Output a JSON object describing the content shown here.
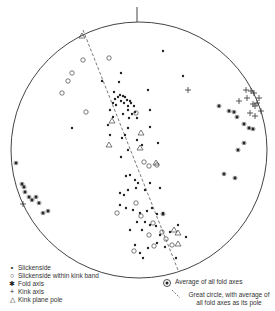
{
  "diagram": {
    "type": "stereonet",
    "center": [
      139,
      150
    ],
    "radius": 128,
    "north_tick": true,
    "great_circle_dashed": {
      "x1": 83,
      "y1": 30,
      "x2": 178,
      "y2": 270
    },
    "series": {
      "slickenside": [
        [
          163,
          51
        ],
        [
          121,
          73
        ],
        [
          119,
          82
        ],
        [
          102,
          81
        ],
        [
          148,
          90
        ],
        [
          114,
          92
        ],
        [
          120,
          95
        ],
        [
          123,
          96
        ],
        [
          118,
          97
        ],
        [
          125,
          97
        ],
        [
          115,
          99
        ],
        [
          127,
          100
        ],
        [
          121,
          101
        ],
        [
          130,
          101
        ],
        [
          113,
          103
        ],
        [
          124,
          103
        ],
        [
          131,
          103
        ],
        [
          116,
          105
        ],
        [
          128,
          106
        ],
        [
          134,
          106
        ],
        [
          110,
          110
        ],
        [
          128,
          110
        ],
        [
          135,
          112
        ],
        [
          150,
          110
        ],
        [
          113,
          117
        ],
        [
          123,
          114
        ],
        [
          132,
          114
        ],
        [
          129,
          118
        ],
        [
          137,
          118
        ],
        [
          108,
          125
        ],
        [
          128,
          128
        ],
        [
          150,
          127
        ],
        [
          110,
          135
        ],
        [
          122,
          138
        ],
        [
          125,
          135
        ],
        [
          137,
          140
        ],
        [
          142,
          145
        ],
        [
          128,
          150
        ],
        [
          158,
          143
        ],
        [
          121,
          157
        ],
        [
          126,
          176
        ],
        [
          130,
          175
        ],
        [
          135,
          180
        ],
        [
          138,
          183
        ],
        [
          136,
          188
        ],
        [
          120,
          193
        ],
        [
          128,
          190
        ],
        [
          124,
          195
        ],
        [
          145,
          190
        ],
        [
          150,
          183
        ],
        [
          160,
          188
        ],
        [
          120,
          205
        ],
        [
          126,
          208
        ],
        [
          133,
          210
        ],
        [
          140,
          213
        ],
        [
          147,
          211
        ],
        [
          152,
          208
        ],
        [
          157,
          214
        ],
        [
          163,
          213
        ],
        [
          137,
          222
        ],
        [
          145,
          222
        ],
        [
          150,
          225
        ],
        [
          156,
          226
        ],
        [
          142,
          230
        ],
        [
          130,
          230
        ],
        [
          170,
          232
        ],
        [
          178,
          225
        ],
        [
          160,
          235
        ],
        [
          157,
          243
        ],
        [
          165,
          247
        ],
        [
          148,
          248
        ],
        [
          135,
          245
        ],
        [
          140,
          253
        ],
        [
          143,
          258
        ],
        [
          176,
          258
        ],
        [
          72,
          128
        ],
        [
          183,
          76
        ],
        [
          186,
          237
        ]
      ],
      "slickenside_in_kink": [
        [
          83,
          60
        ],
        [
          109,
          58
        ],
        [
          72,
          73
        ],
        [
          68,
          81
        ],
        [
          62,
          93
        ],
        [
          86,
          112
        ],
        [
          136,
          113
        ],
        [
          144,
          162
        ],
        [
          149,
          166
        ],
        [
          157,
          165
        ],
        [
          117,
          213
        ],
        [
          136,
          203
        ],
        [
          141,
          216
        ],
        [
          153,
          223
        ],
        [
          149,
          235
        ],
        [
          162,
          232
        ],
        [
          166,
          239
        ],
        [
          172,
          245
        ],
        [
          154,
          246
        ],
        [
          134,
          251
        ]
      ],
      "fold_axis": [
        [
          219,
          106
        ],
        [
          229,
          111
        ],
        [
          234,
          112
        ],
        [
          237,
          117
        ],
        [
          244,
          124
        ],
        [
          249,
          128
        ],
        [
          253,
          129
        ],
        [
          244,
          143
        ],
        [
          238,
          150
        ],
        [
          224,
          174
        ],
        [
          235,
          178
        ],
        [
          16,
          163
        ],
        [
          22,
          184
        ],
        [
          24,
          187
        ],
        [
          25,
          192
        ],
        [
          29,
          197
        ],
        [
          32,
          200
        ],
        [
          36,
          197
        ],
        [
          39,
          203
        ],
        [
          43,
          213
        ],
        [
          48,
          211
        ],
        [
          163,
          214
        ]
      ],
      "kink_axis": [
        [
          188,
          90
        ],
        [
          246,
          90
        ],
        [
          251,
          91
        ],
        [
          254,
          93
        ],
        [
          239,
          101
        ],
        [
          247,
          98
        ],
        [
          253,
          104
        ],
        [
          259,
          98
        ],
        [
          257,
          103
        ],
        [
          255,
          106
        ],
        [
          261,
          111
        ],
        [
          250,
          113
        ],
        [
          255,
          116
        ],
        [
          23,
          204
        ]
      ],
      "kink_pole": [
        [
          82,
          36
        ],
        [
          112,
          121
        ],
        [
          109,
          145
        ],
        [
          140,
          148
        ],
        [
          156,
          163
        ],
        [
          174,
          230
        ],
        [
          178,
          233
        ],
        [
          178,
          244
        ],
        [
          141,
          133
        ]
      ]
    },
    "average_fold_axes": [
      193,
      279
    ]
  },
  "legend": {
    "items": [
      {
        "symbol": "•",
        "label": "Slickenside"
      },
      {
        "symbol": "○",
        "label": "Slickenside within kink band"
      },
      {
        "symbol": "✱",
        "label": "Fold axis"
      },
      {
        "symbol": "+",
        "label": "Kink axis"
      },
      {
        "symbol": "△",
        "label": "Kink plane pole"
      }
    ]
  },
  "annotations": {
    "average": "Average of all fold axes",
    "great_circle": "Great circle, with average of all fold axes as its pole"
  }
}
